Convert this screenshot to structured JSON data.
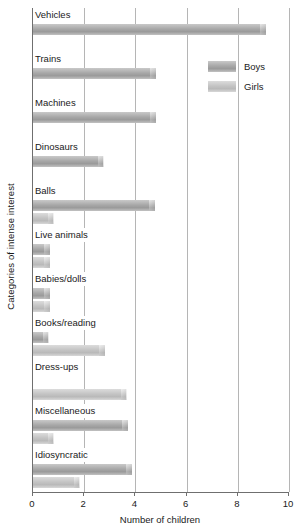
{
  "chart_data": {
    "type": "bar",
    "orientation": "horizontal",
    "title": "",
    "xlabel": "Number of children",
    "ylabel": "Categories of intense interest",
    "xlim": [
      0,
      10
    ],
    "xticks": [
      0,
      2,
      4,
      6,
      8,
      10
    ],
    "xticklabels": [
      "0",
      "2",
      "4",
      "6",
      "8",
      "10"
    ],
    "grid": "vertical",
    "legend_position": "upper right",
    "categories": [
      "Vehicles",
      "Trains",
      "Machines",
      "Dinosaurs",
      "Balls",
      "Live animals",
      "Babies/dolls",
      "Books/reading",
      "Dress-ups",
      "Miscellaneous",
      "Idiosyncratic"
    ],
    "series": [
      {
        "name": "Boys",
        "color": "#a8a8a8",
        "values": [
          9.1,
          4.8,
          4.8,
          2.75,
          4.75,
          0.65,
          0.65,
          0.6,
          0,
          3.7,
          3.85
        ]
      },
      {
        "name": "Girls",
        "color": "#c4c4c4",
        "values": [
          0,
          0,
          0,
          0,
          0.8,
          0.65,
          0.65,
          2.8,
          3.65,
          0.8,
          1.8
        ]
      }
    ]
  },
  "legend": {
    "items": [
      {
        "label": "Boys"
      },
      {
        "label": "Girls"
      }
    ]
  }
}
